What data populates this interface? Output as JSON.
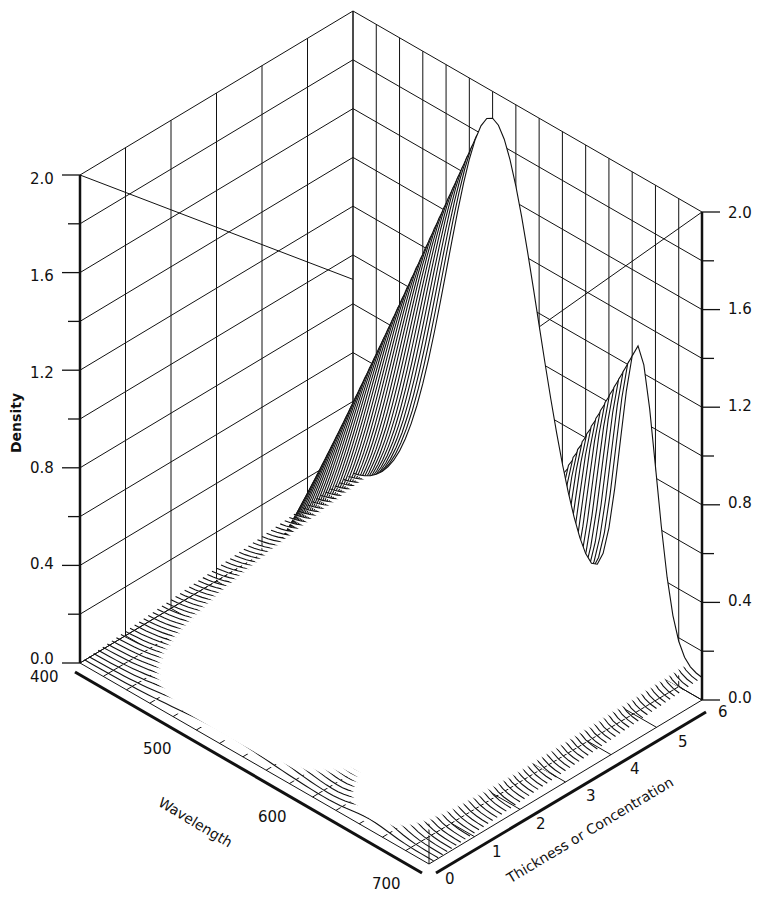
{
  "chart_data": {
    "type": "surface3d",
    "title": "",
    "xlabel": "Wavelength",
    "ylabel": "Thickness or Concentration",
    "zlabel": "Density",
    "x_ticks": [
      "400",
      "500",
      "600",
      "700"
    ],
    "y_ticks": [
      "0",
      "1",
      "2",
      "3",
      "4",
      "5",
      "6"
    ],
    "z_ticks_left": [
      "0.0",
      "0.4",
      "0.8",
      "1.2",
      "1.6",
      "2.0"
    ],
    "z_ticks_right": [
      "0.0",
      "0.4",
      "0.8",
      "1.2",
      "1.6",
      "2.0"
    ],
    "xlim": [
      400,
      700
    ],
    "ylim": [
      0,
      6
    ],
    "zlim": [
      0,
      2.0
    ],
    "grid": true,
    "series": [
      {
        "name": "band_1",
        "peak_wavelength": 520,
        "density_at_thickness": {
          "0": 0.0,
          "1": 0.3,
          "2": 0.6,
          "3": 0.9,
          "4": 1.2,
          "5": 1.5,
          "6": 1.8
        }
      },
      {
        "name": "band_2",
        "peak_wavelength": 640,
        "density_at_thickness": {
          "0": 0.0,
          "1": 0.2,
          "2": 0.4,
          "3": 0.6,
          "4": 0.8,
          "5": 1.0,
          "6": 1.2
        }
      }
    ],
    "colors": {
      "line": "#111111",
      "background": "#ffffff"
    }
  },
  "labels": {
    "density": "Density",
    "wavelength": "Wavelength",
    "thickness": "Thickness or Concentration"
  }
}
